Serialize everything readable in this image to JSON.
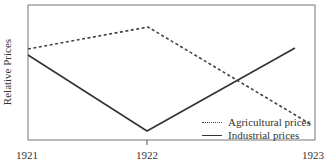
{
  "chart_data": {
    "type": "line",
    "title": "",
    "xlabel": "",
    "ylabel": "Relative Prices",
    "x": [
      "1921",
      "1922",
      "1923"
    ],
    "series": [
      {
        "name": "Agricultural prices",
        "style": "dashed",
        "values": [
          0.68,
          0.85,
          0.12
        ],
        "color": "#444444"
      },
      {
        "name": "Industrial prices",
        "style": "solid",
        "values": [
          0.63,
          0.07,
          0.69
        ],
        "color": "#333333"
      }
    ],
    "series_points_px": {
      "Agricultural prices": [
        [
          28,
          49
        ],
        [
          148,
          27
        ],
        [
          312,
          125
        ]
      ],
      "Industrial prices": [
        [
          28,
          55
        ],
        [
          147,
          131
        ],
        [
          295,
          48
        ]
      ]
    },
    "ylim": [
      0,
      1
    ],
    "grid": false,
    "legend_position": "lower right inside",
    "y_ticks": "none (unlabeled)"
  },
  "axis": {
    "ylabel": "Relative Prices",
    "x_ticks": [
      {
        "label": "1921",
        "x": 27
      },
      {
        "label": "1922",
        "x": 147
      },
      {
        "label": "1923",
        "x": 315
      }
    ]
  },
  "legend": {
    "items": [
      {
        "label": "Agricultural prices",
        "style": "dashed"
      },
      {
        "label": "Industrial prices",
        "style": "solid"
      }
    ]
  }
}
